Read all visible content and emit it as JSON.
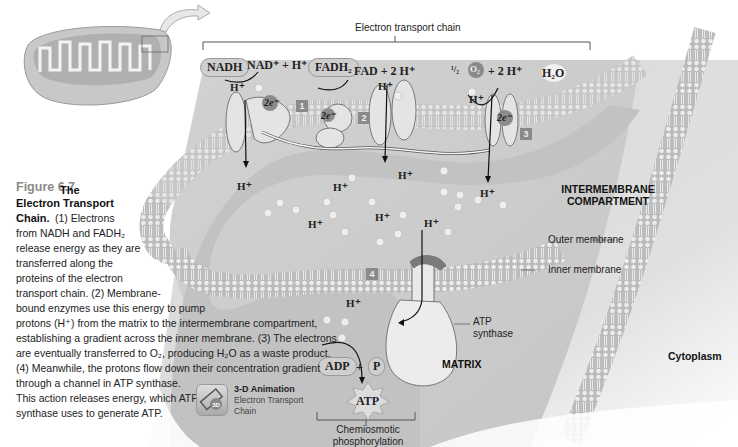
{
  "figure": {
    "number": "Figure 6.7",
    "title_bold": "The Electron Transport Chain.",
    "caption_lines": [
      "(1) Electrons",
      "from NADH and FADH₂",
      "release energy as they are",
      "transferred along the",
      "proteins of the electron",
      "transport chain. (2) Membrane-",
      "bound enzymes use this energy to pump",
      "protons (H⁺) from the matrix to the intermembrane compartment,",
      "establishing a gradient across the inner membrane. (3) The electrons",
      "are eventually transferred to O₂, producing H₂O as a waste product.",
      "(4) Meanwhile, the protons flow down their concentration gradient",
      "through a channel in ATP synthase.",
      "This action releases energy, which ATP",
      "synthase uses to generate ATP."
    ]
  },
  "animation_link": {
    "icon": "3d-animation-icon",
    "icon_text": "3D",
    "title": "3-D Animation",
    "subtitle": "Electron Transport Chain"
  },
  "labels": {
    "electron_transport_chain": "Electron transport chain",
    "intermembrane": "INTERMEMBRANE COMPARTMENT",
    "outer_membrane": "Outer membrane",
    "inner_membrane": "Inner membrane",
    "atp_synthase": "ATP synthase",
    "matrix": "MATRIX",
    "cytoplasm": "Cytoplasm",
    "chemiosmotic": "Chemiosmotic phosphorylation"
  },
  "chemistry": {
    "nadh": "NADH",
    "nad_products": "NAD⁺ + H⁺",
    "fadh2": "FADH₂",
    "fad_products": "FAD + 2 H⁺",
    "half": "¹/₂",
    "o2": "O₂",
    "o2_products": "+ 2 H⁺",
    "h2o": "H₂O",
    "adp": "ADP",
    "plus": "+",
    "p": "P",
    "atp": "ATP",
    "electrons": "2e⁻",
    "proton": "H⁺"
  },
  "complex_numbers": [
    "1",
    "2",
    "3",
    "4"
  ]
}
